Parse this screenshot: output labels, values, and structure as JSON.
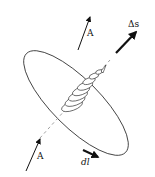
{
  "diagram": {
    "labels": {
      "field_top": "A",
      "field_bottom": "A",
      "area_vector": "Δs",
      "line_element": "dl"
    },
    "colors": {
      "stroke": "#222222",
      "background": "#ffffff"
    }
  }
}
